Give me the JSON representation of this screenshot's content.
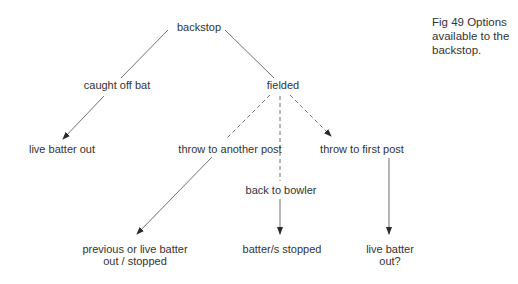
{
  "caption": {
    "line1": "Fig 49  Options",
    "line2": "available to the",
    "line3": "backstop."
  },
  "nodes": {
    "backstop": "backstop",
    "caught_off_bat": "caught off bat",
    "fielded": "fielded",
    "live_batter_out": "live batter out",
    "throw_to_another_post": "throw to another post",
    "throw_to_first_post": "throw to first post",
    "back_to_bowler": "back to bowler",
    "previous_or_live_line1": "previous or live batter",
    "previous_or_live_line2": "out / stopped",
    "batters_stopped": "batter/s stopped",
    "live_batter_out_q_line1": "live batter",
    "live_batter_out_q_line2": "out?"
  },
  "edges": [
    {
      "from": "backstop",
      "to": "caught off bat",
      "style": "solid",
      "arrow": false
    },
    {
      "from": "backstop",
      "to": "fielded",
      "style": "solid",
      "arrow": false
    },
    {
      "from": "caught off bat",
      "to": "live batter out",
      "style": "solid",
      "arrow": true
    },
    {
      "from": "fielded",
      "to": "throw to another post",
      "style": "dashed",
      "arrow": false
    },
    {
      "from": "fielded",
      "to": "back to bowler",
      "style": "dashed",
      "arrow": false
    },
    {
      "from": "fielded",
      "to": "throw to first post",
      "style": "dashed",
      "arrow": true
    },
    {
      "from": "throw to another post",
      "to": "previous or live batter out / stopped",
      "style": "solid",
      "arrow": true
    },
    {
      "from": "back to bowler",
      "to": "batter/s stopped",
      "style": "solid",
      "arrow": true
    },
    {
      "from": "throw to first post",
      "to": "live batter out?",
      "style": "solid",
      "arrow": true
    }
  ],
  "colors": {
    "line": "#3a3a3a",
    "text": "#333333",
    "background": "#ffffff"
  }
}
